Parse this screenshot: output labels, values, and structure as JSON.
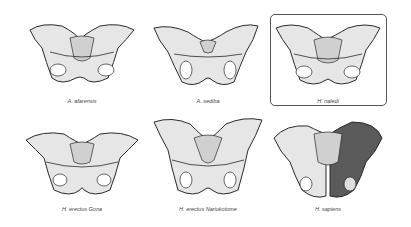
{
  "figure": {
    "highlighted": "H. naledi",
    "colors": {
      "bone": "#e6e6e6",
      "outline": "#2a2a2a",
      "shade": "#bdbdbd",
      "dark_half": "#5a5a5a",
      "box_border": "#555555"
    },
    "specimens": [
      {
        "id": "a-afarensis",
        "label": "A. afarensis",
        "row": 1,
        "col": 1
      },
      {
        "id": "a-sediba",
        "label": "A. sediba",
        "row": 1,
        "col": 2
      },
      {
        "id": "h-naledi",
        "label": "H. naledi",
        "row": 1,
        "col": 3
      },
      {
        "id": "h-erectus-gona",
        "label": "H. erectus Gona",
        "row": 2,
        "col": 1
      },
      {
        "id": "h-erectus-nariokotome",
        "label": "H. erectus Nariokotome",
        "row": 2,
        "col": 2
      },
      {
        "id": "h-sapiens",
        "label": "H. sapiens",
        "row": 2,
        "col": 3
      }
    ]
  }
}
